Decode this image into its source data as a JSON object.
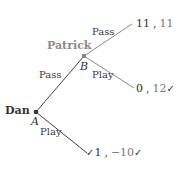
{
  "diagram": {
    "type": "game-tree",
    "players": {
      "first": {
        "name": "Dan",
        "node": "A",
        "color": "#333333"
      },
      "second": {
        "name": "Patrick",
        "node": "B",
        "color": "#8c8c8c"
      }
    },
    "nodes": {
      "A": {
        "label": "A",
        "player": "Dan"
      },
      "B": {
        "label": "B",
        "player": "Patrick"
      }
    },
    "edges": [
      {
        "from": "A",
        "to": "B",
        "label": "Pass"
      },
      {
        "from": "A",
        "to": "terminal-3",
        "label": "Play"
      },
      {
        "from": "B",
        "to": "terminal-1",
        "label": "Pass"
      },
      {
        "from": "B",
        "to": "terminal-2",
        "label": "Play"
      }
    ],
    "terminals": [
      {
        "id": "terminal-1",
        "p1": "11",
        "sep": ",",
        "p2": "11",
        "check_before": "",
        "check_after": ""
      },
      {
        "id": "terminal-2",
        "p1": "0",
        "sep": ",",
        "p2": "12",
        "check_before": "",
        "check_after": "✓"
      },
      {
        "id": "terminal-3",
        "p1": "1",
        "sep": ",",
        "p2": "−10",
        "check_before": "✓",
        "check_after": "✓"
      }
    ]
  }
}
